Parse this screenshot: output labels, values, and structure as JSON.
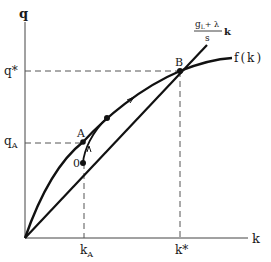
{
  "diagram": {
    "axes": {
      "y_label": "q",
      "x_label": "k"
    },
    "ticks": {
      "q_star": "q*",
      "q_A": "q",
      "q_A_sub": "A",
      "k_A": "k",
      "k_A_sub": "A",
      "k_star": "k*"
    },
    "points": {
      "A": "A",
      "B": "B",
      "zero": "0"
    },
    "curves": {
      "production": "f(k)",
      "line_num_main": "g",
      "line_num_sub": "L",
      "line_num_rest": "+ λ",
      "line_den": "s",
      "line_var": "k"
    },
    "colors": {
      "ink": "#111111",
      "dashed": "#555555",
      "axis": "#444444"
    }
  }
}
